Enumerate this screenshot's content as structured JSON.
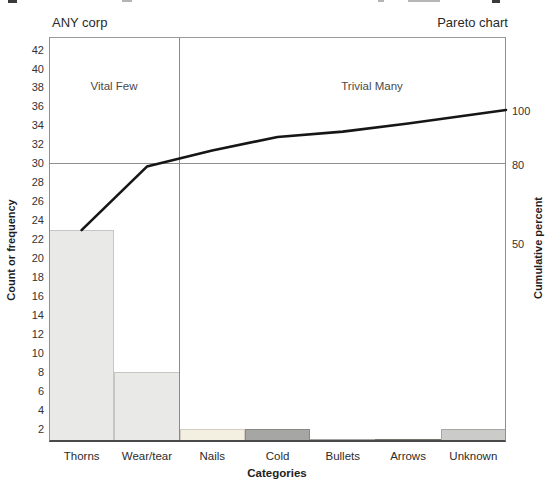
{
  "chart_data": {
    "type": "bar",
    "subtype": "pareto",
    "company": "ANY corp",
    "title": "Pareto chart",
    "categories": [
      "Thorns",
      "Wear/tear",
      "Nails",
      "Cold",
      "Bullets",
      "Arrows",
      "Unknown"
    ],
    "series": [
      {
        "name": "Count or frequency",
        "type": "bar",
        "values": [
          23,
          8,
          2,
          2,
          1,
          1,
          2
        ]
      },
      {
        "name": "Cumulative percent",
        "type": "line",
        "values": [
          59,
          79,
          85,
          90,
          92,
          95,
          100
        ]
      }
    ],
    "xlabel": "Categories",
    "ylabel": "Count or frequency",
    "ylabel_right": "Cumulative percent",
    "ylim_left": [
      0,
      43
    ],
    "left_ticks": [
      42,
      40,
      38,
      36,
      34,
      32,
      30,
      28,
      26,
      24,
      22,
      20,
      18,
      16,
      14,
      12,
      10,
      8,
      6,
      4,
      2
    ],
    "right_ticks": [
      100,
      80,
      50
    ],
    "grid": "off",
    "reference_line_percent": 80,
    "reference_line_count": 30,
    "divider_after_category": "Wear/tear",
    "region_labels": {
      "left": "Vital Few",
      "right": "Trivial Many"
    },
    "bar_colors": [
      "#e9e9e7",
      "#e9e9e7",
      "#f3f0e2",
      "#a6a6a4",
      "#c3c3c1",
      "#92928c",
      "#cbcbc9"
    ],
    "bar_border_colors": [
      "#c6c6c4",
      "#c6c6c4",
      "#d2cfc0",
      "#878785",
      "#a3a3a1",
      "#74746d",
      "#a7a7a5"
    ],
    "line_color": "#161616",
    "reference_line_color": "#8f8f8f"
  }
}
